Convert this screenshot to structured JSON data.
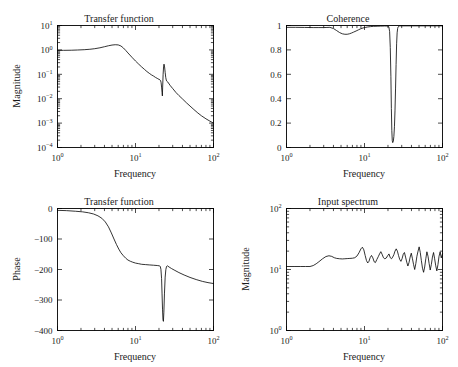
{
  "figure": {
    "background": "#ffffff",
    "line_color": "#000000",
    "subplot_count": 4
  },
  "chart_data": [
    {
      "id": "transfer-function-magnitude",
      "position": "top-left",
      "type": "line",
      "title": "Transfer function",
      "xlabel": "Frequency",
      "ylabel": "Magnitude",
      "xscale": "log",
      "yscale": "log",
      "xlim": [
        1,
        100
      ],
      "ylim": [
        0.0001,
        10
      ],
      "xticklabels": [
        "10^0",
        "10^1",
        "10^2"
      ],
      "xtickvalues": [
        1,
        10,
        100
      ],
      "yticklabels": [
        "10^1",
        "10^0",
        "10^-1",
        "10^-2",
        "10^-3",
        "10^-4"
      ],
      "ytickvalues": [
        10,
        1,
        0.1,
        0.01,
        0.001,
        0.0001
      ],
      "grid": false,
      "legend": "none",
      "x": [
        1.0,
        1.2,
        1.5,
        1.8,
        2.2,
        2.6,
        3.0,
        3.5,
        4.0,
        4.5,
        5.0,
        5.5,
        6.0,
        6.5,
        7.0,
        7.5,
        8.0,
        9.0,
        10.0,
        11.0,
        12.0,
        13.0,
        14.0,
        15.0,
        16.0,
        17.0,
        18.0,
        19.0,
        20.0,
        20.6,
        21.0,
        21.3,
        21.6,
        21.9,
        22.1,
        22.3,
        22.6,
        22.9,
        23.2,
        23.6,
        24.0,
        24.4,
        24.8,
        25.2,
        25.6,
        26.0,
        27.0,
        28.0,
        30.0,
        33.0,
        36.0,
        40.0,
        45.0,
        50.0,
        56.0,
        63.0,
        70.0,
        80.0,
        90.0,
        100.0
      ],
      "y": [
        0.95,
        0.96,
        0.97,
        0.99,
        1.02,
        1.06,
        1.12,
        1.22,
        1.35,
        1.48,
        1.58,
        1.63,
        1.6,
        1.45,
        1.2,
        0.95,
        0.75,
        0.5,
        0.35,
        0.26,
        0.2,
        0.16,
        0.13,
        0.11,
        0.095,
        0.085,
        0.075,
        0.068,
        0.062,
        0.059,
        0.055,
        0.045,
        0.03,
        0.018,
        0.013,
        0.03,
        0.1,
        0.2,
        0.26,
        0.2,
        0.12,
        0.075,
        0.058,
        0.052,
        0.05,
        0.048,
        0.04,
        0.034,
        0.026,
        0.018,
        0.0135,
        0.0098,
        0.0068,
        0.005,
        0.0036,
        0.0026,
        0.002,
        0.0015,
        0.0012,
        0.001
      ]
    },
    {
      "id": "coherence",
      "position": "top-right",
      "type": "line",
      "title": "Coherence",
      "xlabel": "Frequency",
      "ylabel": "",
      "xscale": "log",
      "yscale": "linear",
      "xlim": [
        1,
        100
      ],
      "ylim": [
        0,
        1
      ],
      "xticklabels": [
        "10^0",
        "10^1",
        "10^2"
      ],
      "xtickvalues": [
        1,
        10,
        100
      ],
      "yticklabels": [
        "0",
        "0.2",
        "0.4",
        "0.6",
        "0.8",
        "1"
      ],
      "ytickvalues": [
        0,
        0.2,
        0.4,
        0.6,
        0.8,
        1
      ],
      "grid": false,
      "legend": "none",
      "x": [
        1.0,
        1.3,
        1.7,
        2.2,
        2.6,
        3.0,
        3.3,
        3.6,
        4.0,
        4.4,
        4.8,
        5.2,
        5.6,
        6.0,
        6.4,
        6.8,
        7.2,
        7.8,
        8.4,
        9.0,
        9.6,
        10.2,
        11.0,
        12.0,
        13.0,
        14.5,
        16.0,
        18.0,
        19.5,
        20.5,
        21.0,
        21.4,
        21.8,
        22.1,
        22.4,
        22.7,
        23.0,
        23.4,
        23.8,
        24.2,
        24.6,
        25.0,
        25.4,
        25.8,
        26.2,
        26.6,
        27.0,
        27.4,
        28.0,
        29.0,
        31.0,
        34.0,
        40.0,
        50.0,
        65.0,
        80.0,
        100.0
      ],
      "y": [
        0.985,
        0.985,
        0.984,
        0.983,
        0.983,
        0.983,
        0.984,
        0.985,
        0.975,
        0.958,
        0.942,
        0.932,
        0.928,
        0.928,
        0.932,
        0.938,
        0.945,
        0.955,
        0.965,
        0.974,
        0.98,
        0.984,
        0.988,
        0.991,
        0.993,
        0.994,
        0.995,
        0.996,
        0.996,
        0.99,
        0.95,
        0.82,
        0.58,
        0.32,
        0.14,
        0.055,
        0.04,
        0.05,
        0.09,
        0.17,
        0.3,
        0.48,
        0.68,
        0.85,
        0.94,
        0.975,
        0.988,
        0.993,
        0.996,
        0.997,
        0.997,
        0.997,
        0.997,
        0.997,
        0.997,
        0.997,
        0.997
      ]
    },
    {
      "id": "transfer-function-phase",
      "position": "bottom-left",
      "type": "line",
      "title": "Transfer function",
      "xlabel": "Frequency",
      "ylabel": "Phase",
      "xscale": "log",
      "yscale": "linear",
      "xlim": [
        1,
        100
      ],
      "ylim": [
        -400,
        0
      ],
      "xticklabels": [
        "10^0",
        "10^1",
        "10^2"
      ],
      "xtickvalues": [
        1,
        10,
        100
      ],
      "yticklabels": [
        "0",
        "-100",
        "-200",
        "-300",
        "-400"
      ],
      "ytickvalues": [
        0,
        -100,
        -200,
        -300,
        -400
      ],
      "grid": false,
      "legend": "none",
      "x": [
        1.0,
        1.3,
        1.7,
        2.1,
        2.5,
        2.9,
        3.3,
        3.7,
        4.1,
        4.5,
        4.9,
        5.3,
        5.7,
        6.1,
        6.5,
        7.0,
        7.5,
        8.0,
        8.6,
        9.2,
        10.0,
        11.0,
        12.0,
        13.5,
        15.0,
        17.0,
        19.0,
        20.2,
        20.8,
        21.2,
        21.6,
        21.9,
        22.2,
        22.5,
        22.8,
        23.1,
        23.5,
        24.0,
        24.5,
        25.0,
        25.6,
        26.0,
        27.0,
        29.0,
        32.0,
        36.0,
        42.0,
        50.0,
        60.0,
        72.0,
        85.0,
        100.0
      ],
      "y": [
        -6,
        -7,
        -9,
        -11,
        -14,
        -18,
        -24,
        -32,
        -44,
        -60,
        -80,
        -100,
        -118,
        -133,
        -145,
        -155,
        -163,
        -169,
        -173,
        -176,
        -179,
        -181,
        -183,
        -184,
        -185,
        -186,
        -187,
        -188,
        -190,
        -200,
        -230,
        -280,
        -330,
        -365,
        -370,
        -340,
        -280,
        -225,
        -200,
        -190,
        -188,
        -189,
        -192,
        -197,
        -203,
        -210,
        -218,
        -226,
        -233,
        -239,
        -243,
        -246
      ]
    },
    {
      "id": "input-spectrum",
      "position": "bottom-right",
      "type": "line",
      "title": "Input spectrum",
      "xlabel": "Frequency",
      "ylabel": "Magnitude",
      "xscale": "log",
      "yscale": "log",
      "xlim": [
        1,
        100
      ],
      "ylim": [
        1,
        100
      ],
      "xticklabels": [
        "10^0",
        "10^1",
        "10^2"
      ],
      "xtickvalues": [
        1,
        10,
        100
      ],
      "yticklabels": [
        "10^2",
        "10^1",
        "10^0"
      ],
      "ytickvalues": [
        100,
        10,
        1
      ],
      "grid": false,
      "legend": "none",
      "x": [
        1.0,
        1.25,
        1.5,
        1.75,
        2.0,
        2.2,
        2.4,
        2.6,
        2.9,
        3.2,
        3.5,
        3.8,
        4.1,
        4.4,
        4.8,
        5.2,
        5.6,
        6.0,
        6.5,
        7.0,
        7.5,
        8.0,
        8.5,
        9.0,
        9.4,
        9.8,
        10.2,
        10.6,
        11.0,
        11.4,
        11.8,
        12.3,
        12.8,
        13.3,
        13.8,
        14.4,
        15.0,
        15.6,
        16.2,
        16.8,
        17.5,
        18.2,
        19.0,
        19.8,
        20.6,
        21.4,
        22.2,
        23.0,
        23.8,
        24.6,
        25.5,
        26.4,
        27.3,
        28.3,
        29.3,
        30.3,
        31.4,
        32.5,
        33.6,
        34.8,
        36.0,
        37.2,
        38.5,
        39.8,
        41.2,
        42.6,
        44.0,
        45.5,
        47.0,
        48.6,
        50.2,
        51.9,
        53.6,
        55.4,
        57.2,
        59.1,
        61.1,
        63.1,
        65.2,
        67.4,
        69.6,
        71.9,
        74.3,
        76.8,
        79.3,
        81.9,
        84.6,
        87.4,
        90.3,
        93.3,
        96.4,
        100.0
      ],
      "y": [
        11.2,
        11.2,
        11.2,
        11.2,
        11.2,
        11.6,
        12.4,
        13.4,
        15.0,
        16.3,
        16.8,
        16.4,
        15.6,
        15.2,
        15.0,
        14.9,
        15.0,
        15.1,
        15.2,
        15.3,
        15.6,
        16.6,
        18.8,
        21.8,
        23.2,
        21.0,
        17.0,
        14.0,
        12.8,
        13.6,
        15.6,
        17.0,
        15.5,
        13.4,
        13.0,
        14.6,
        16.2,
        18.0,
        19.6,
        17.8,
        15.6,
        15.0,
        15.4,
        16.8,
        18.0,
        15.6,
        15.0,
        16.0,
        17.5,
        20.0,
        21.8,
        20.0,
        17.0,
        14.6,
        13.6,
        15.0,
        17.8,
        19.0,
        16.0,
        13.2,
        11.4,
        13.0,
        16.0,
        18.5,
        15.0,
        12.0,
        10.0,
        12.5,
        16.5,
        20.0,
        23.5,
        19.0,
        14.0,
        10.5,
        9.0,
        11.0,
        15.0,
        19.5,
        16.5,
        12.5,
        9.8,
        12.0,
        16.0,
        19.0,
        15.0,
        11.5,
        9.5,
        12.0,
        16.5,
        19.5,
        15.5,
        18.0
      ]
    }
  ]
}
